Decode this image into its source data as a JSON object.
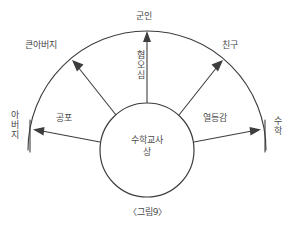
{
  "figure": {
    "caption": "〈그림9〉",
    "center_node": {
      "name": "center-node",
      "text": "수학교사\n상"
    },
    "outer_nodes": [
      {
        "id": "father",
        "label": "아버지",
        "orientation": "vertical",
        "position": "left"
      },
      {
        "id": "uncle",
        "label": "큰아버지",
        "orientation": "horizontal",
        "position": "upper-left"
      },
      {
        "id": "soldier",
        "label": "군인",
        "orientation": "horizontal",
        "position": "top"
      },
      {
        "id": "friend",
        "label": "친구",
        "orientation": "horizontal",
        "position": "upper-right"
      },
      {
        "id": "mathematics",
        "label": "수학",
        "orientation": "vertical",
        "position": "right"
      }
    ],
    "edge_labels": [
      {
        "id": "fear",
        "label": "공포",
        "orientation": "horizontal",
        "from": "center-node",
        "to": "father"
      },
      {
        "id": "disgust",
        "label": "혐오심",
        "orientation": "vertical",
        "from": "center-node",
        "to": "soldier"
      },
      {
        "id": "inferiority",
        "label": "열등감",
        "orientation": "horizontal",
        "from": "center-node",
        "to": "mathematics"
      }
    ],
    "colors": {
      "background": "#ffffff",
      "stroke": "#3d3d3d",
      "text": "#4a4a4a"
    }
  }
}
